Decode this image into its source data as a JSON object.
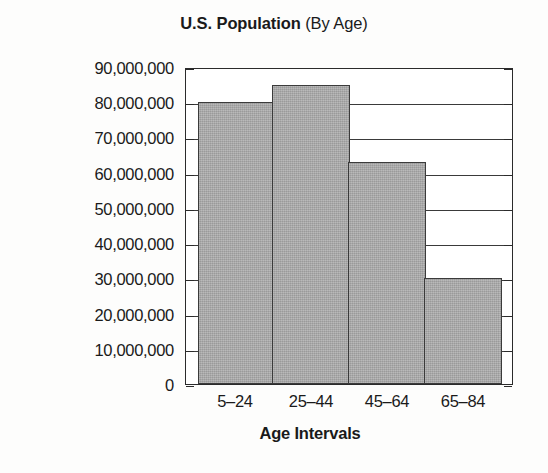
{
  "chart_data": {
    "type": "bar",
    "title": "U.S. Population (By Age)",
    "title_main": "U.S. Population",
    "title_sub": "(By Age)",
    "xlabel": "Age Intervals",
    "ylabel": "Frequency",
    "categories": [
      "5–24",
      "25–44",
      "45–64",
      "65–84"
    ],
    "values": [
      80000000,
      85000000,
      63000000,
      30000000
    ],
    "ylim": [
      0,
      90000000
    ],
    "ytick_values": [
      0,
      10000000,
      20000000,
      30000000,
      40000000,
      50000000,
      60000000,
      70000000,
      80000000,
      90000000
    ],
    "ytick_labels": [
      "0",
      "10,000,000",
      "20,000,000",
      "30,000,000",
      "40,000,000",
      "50,000,000",
      "60,000,000",
      "70,000,000",
      "80,000,000",
      "90,000,000"
    ],
    "grid": true,
    "grid_axis": "y",
    "legend": false,
    "bar_gap": 0,
    "bar_fill_color": "#a9a9a9",
    "bar_border_color": "#3b3b3b",
    "axis_color": "#2b2b2b",
    "background_color": "#ffffff"
  }
}
